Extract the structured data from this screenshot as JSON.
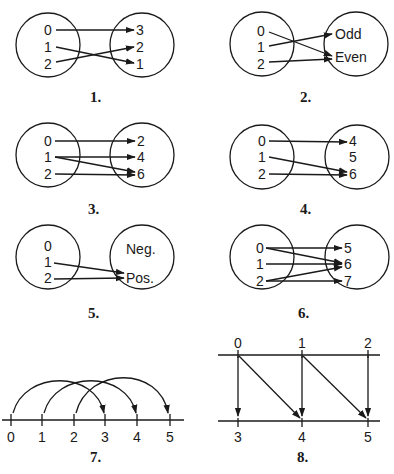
{
  "diagrams": [
    {
      "number": "1.",
      "type": "mapping",
      "domain": [
        "0",
        "1",
        "2"
      ],
      "range": [
        "3",
        "2",
        "1"
      ],
      "arrows": [
        [
          "0",
          "3"
        ],
        [
          "1",
          "1"
        ],
        [
          "2",
          "2"
        ]
      ]
    },
    {
      "number": "2.",
      "type": "mapping",
      "domain": [
        "0",
        "1",
        "2"
      ],
      "range": [
        "Odd",
        "Even"
      ],
      "arrows": [
        [
          "0",
          "Even"
        ],
        [
          "1",
          "Odd"
        ],
        [
          "2",
          "Even"
        ]
      ]
    },
    {
      "number": "3.",
      "type": "mapping",
      "domain": [
        "0",
        "1",
        "2"
      ],
      "range": [
        "2",
        "4",
        "6"
      ],
      "arrows": [
        [
          "0",
          "2"
        ],
        [
          "1",
          "4"
        ],
        [
          "1",
          "6"
        ],
        [
          "2",
          "6"
        ]
      ]
    },
    {
      "number": "4.",
      "type": "mapping",
      "domain": [
        "0",
        "1",
        "2"
      ],
      "range": [
        "4",
        "5",
        "6"
      ],
      "arrows": [
        [
          "0",
          "4"
        ],
        [
          "1",
          "6"
        ],
        [
          "2",
          "6"
        ]
      ]
    },
    {
      "number": "5.",
      "type": "mapping",
      "domain": [
        "0",
        "1",
        "2"
      ],
      "range": [
        "Neg.",
        "Pos."
      ],
      "arrows": [
        [
          "1",
          "Pos."
        ],
        [
          "2",
          "Pos."
        ]
      ]
    },
    {
      "number": "6.",
      "type": "mapping",
      "domain": [
        "0",
        "1",
        "2"
      ],
      "range": [
        "5",
        "6",
        "7"
      ],
      "arrows": [
        [
          "0",
          "5"
        ],
        [
          "0",
          "6"
        ],
        [
          "1",
          "6"
        ],
        [
          "2",
          "6"
        ],
        [
          "2",
          "7"
        ]
      ]
    },
    {
      "number": "7.",
      "type": "number-line-arcs",
      "ticks": [
        "0",
        "1",
        "2",
        "3",
        "4",
        "5"
      ],
      "arrows": [
        [
          "0",
          "3"
        ],
        [
          "1",
          "4"
        ],
        [
          "2",
          "5"
        ]
      ]
    },
    {
      "number": "8.",
      "type": "two-line-mapping",
      "top": [
        "0",
        "1",
        "2"
      ],
      "bottom": [
        "3",
        "4",
        "5"
      ],
      "arrows": [
        [
          "0",
          "3"
        ],
        [
          "0",
          "4"
        ],
        [
          "1",
          "4"
        ],
        [
          "1",
          "5"
        ],
        [
          "2",
          "5"
        ]
      ]
    }
  ]
}
